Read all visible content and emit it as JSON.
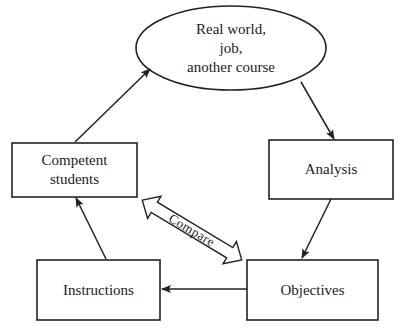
{
  "diagram": {
    "nodes": {
      "real_world": {
        "line1": "Real world,",
        "line2": "job,",
        "line3": "another course"
      },
      "analysis": {
        "label": "Analysis"
      },
      "objectives": {
        "label": "Objectives"
      },
      "instructions": {
        "label": "Instructions"
      },
      "competent_students": {
        "line1": "Competent",
        "line2": "students"
      }
    },
    "compare_label": "Compare",
    "edges": [
      {
        "from": "Real world, job, another course",
        "to": "Analysis"
      },
      {
        "from": "Analysis",
        "to": "Objectives"
      },
      {
        "from": "Objectives",
        "to": "Instructions"
      },
      {
        "from": "Instructions",
        "to": "Competent students"
      },
      {
        "from": "Competent students",
        "to": "Real world, job, another course"
      },
      {
        "between": [
          "Competent students",
          "Objectives"
        ],
        "label": "Compare",
        "type": "double-arrow"
      }
    ],
    "colors": {
      "stroke": "#222222",
      "background": "#ffffff"
    }
  }
}
